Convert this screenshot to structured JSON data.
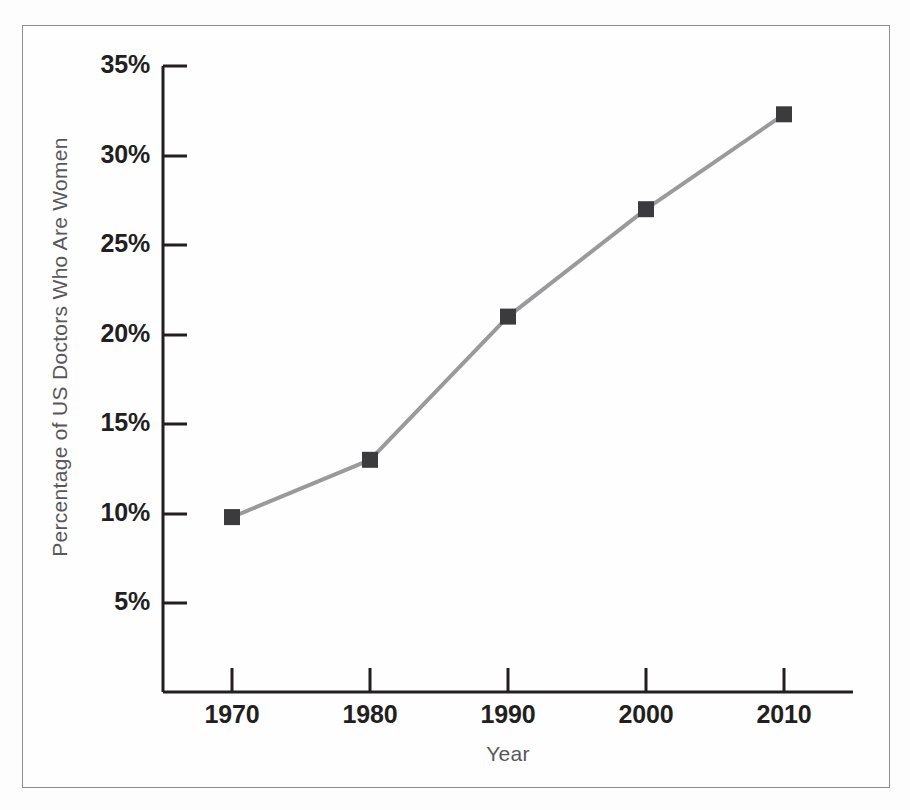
{
  "chart_data": {
    "type": "line",
    "title": "",
    "xlabel": "Year",
    "ylabel": "Percentage of US Doctors Who Are Women",
    "x": [
      1970,
      1980,
      1990,
      2000,
      2010
    ],
    "values": [
      9.8,
      13.0,
      21.0,
      27.0,
      32.3
    ],
    "categories": [
      "1970",
      "1980",
      "1990",
      "2000",
      "2010"
    ],
    "x_tick_labels": [
      "1970",
      "1980",
      "1990",
      "2000",
      "2010"
    ],
    "y_tick_labels": [
      "5%",
      "10%",
      "15%",
      "20%",
      "25%",
      "30%",
      "35%"
    ],
    "y_tick_values": [
      5,
      10,
      15,
      20,
      25,
      30,
      35
    ],
    "xlim": [
      1966,
      2014
    ],
    "ylim": [
      0,
      35
    ],
    "grid": false,
    "legend": null,
    "marker": "square",
    "series": [
      {
        "name": "Percentage of US Doctors Who Are Women",
        "values": [
          9.8,
          13.0,
          21.0,
          27.0,
          32.3
        ]
      }
    ],
    "colors": {
      "line": "#9a9a9c",
      "marker": "#3b3b3d",
      "axis": "#231f20",
      "tick_label": "#231f20",
      "axis_title": "#58585a",
      "frame": "#8d8d8d",
      "background": "#fefefe"
    }
  }
}
